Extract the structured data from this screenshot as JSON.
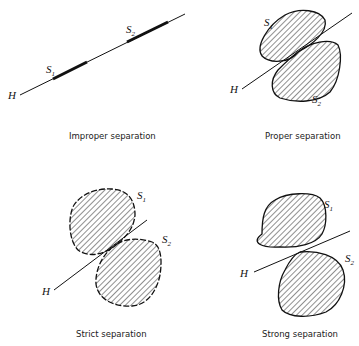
{
  "panels": [
    {
      "id": "improper",
      "caption": "Improper separation",
      "hyperplane_label": "H",
      "set1_label": "S",
      "set1_sub": "1",
      "set2_label": "S",
      "set2_sub": "2"
    },
    {
      "id": "proper",
      "caption": "Proper separation",
      "hyperplane_label": "H",
      "set1_label": "S",
      "set1_sub": "1",
      "set2_label": "S",
      "set2_sub": "2"
    },
    {
      "id": "strict",
      "caption": "Strict separation",
      "hyperplane_label": "H",
      "set1_label": "S",
      "set1_sub": "1",
      "set2_label": "S",
      "set2_sub": "2"
    },
    {
      "id": "strong",
      "caption": "Strong separation",
      "hyperplane_label": "H",
      "set1_label": "S",
      "set1_sub": "1",
      "set2_label": "S",
      "set2_sub": "2"
    }
  ],
  "colors": {
    "stroke": "#111111",
    "hatch": "#222222",
    "background": "#ffffff"
  }
}
